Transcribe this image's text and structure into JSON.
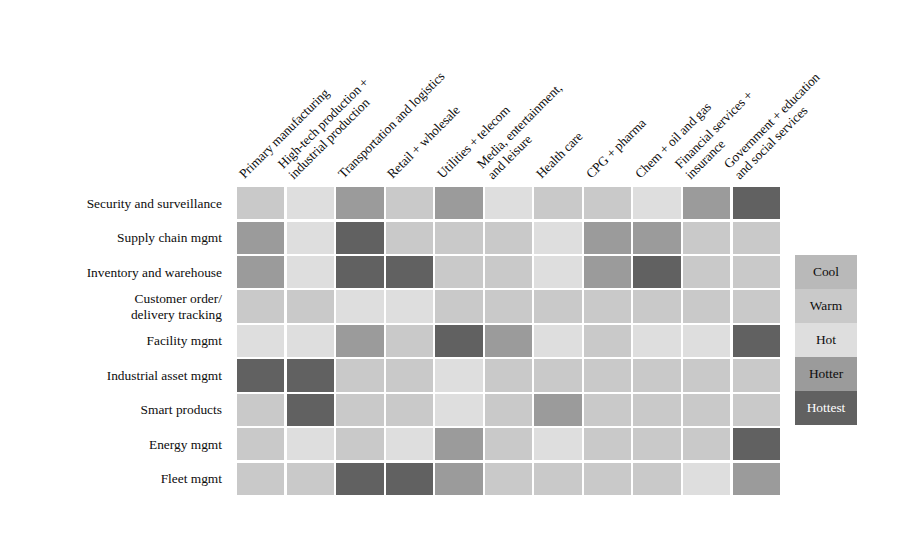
{
  "figure": {
    "type": "heatmap",
    "orientation": "rows-are-use-cases, columns-are-industries"
  },
  "legend": {
    "title": "",
    "items": [
      {
        "label": "Cool",
        "color": "#b9b9b9",
        "level": 1
      },
      {
        "label": "Warm",
        "color": "#c9c9c9",
        "level": 2
      },
      {
        "label": "Hot",
        "color": "#dedede",
        "level": 3
      },
      {
        "label": "Hotter",
        "color": "#9b9b9b",
        "level": 4
      },
      {
        "label": "Hottest",
        "color": "#616161",
        "level": 5
      }
    ]
  },
  "chart_data": {
    "type": "heatmap",
    "title": "",
    "xlabel": "",
    "ylabel": "",
    "grid": true,
    "legend_position": "right",
    "value_scale": [
      "Cool",
      "Warm",
      "Hot",
      "Hotter",
      "Hottest"
    ],
    "colors": {
      "Cool": "#b9b9b9",
      "Warm": "#c9c9c9",
      "Hot": "#dedede",
      "Hotter": "#9b9b9b",
      "Hottest": "#616161"
    },
    "columns": [
      "Primary manufacturing",
      "High-tech production +\nindustrial production",
      "Transportation and logistics",
      "Retail + wholesale",
      "Utilities + telecom",
      "Media, entertainment,\nand leisure",
      "Health care",
      "CPG + pharma",
      "Chem + oil and gas",
      "Financial services +\ninsurance",
      "Government + education\nand social services"
    ],
    "rows": [
      "Security and surveillance",
      "Supply chain mgmt",
      "Inventory and warehouse",
      "Customer order/\ndelivery tracking",
      "Facility mgmt",
      "Industrial asset mgmt",
      "Smart products",
      "Energy mgmt",
      "Fleet mgmt"
    ],
    "values": [
      [
        "Warm",
        "Hot",
        "Hotter",
        "Warm",
        "Hotter",
        "Hot",
        "Warm",
        "Warm",
        "Hot",
        "Hotter",
        "Hottest"
      ],
      [
        "Hotter",
        "Hot",
        "Hottest",
        "Warm",
        "Warm",
        "Warm",
        "Hot",
        "Hotter",
        "Hotter",
        "Warm",
        "Warm"
      ],
      [
        "Hotter",
        "Hot",
        "Hottest",
        "Hottest",
        "Warm",
        "Warm",
        "Hot",
        "Hotter",
        "Hottest",
        "Warm",
        "Warm"
      ],
      [
        "Warm",
        "Warm",
        "Hot",
        "Hot",
        "Warm",
        "Warm",
        "Warm",
        "Warm",
        "Warm",
        "Warm",
        "Warm"
      ],
      [
        "Hot",
        "Hot",
        "Hotter",
        "Warm",
        "Hottest",
        "Hotter",
        "Hot",
        "Warm",
        "Hot",
        "Hot",
        "Hottest"
      ],
      [
        "Hottest",
        "Hottest",
        "Warm",
        "Warm",
        "Hot",
        "Warm",
        "Warm",
        "Warm",
        "Warm",
        "Warm",
        "Warm"
      ],
      [
        "Warm",
        "Hottest",
        "Warm",
        "Warm",
        "Hot",
        "Warm",
        "Hotter",
        "Warm",
        "Warm",
        "Warm",
        "Warm"
      ],
      [
        "Warm",
        "Hot",
        "Warm",
        "Hot",
        "Hotter",
        "Warm",
        "Hot",
        "Warm",
        "Warm",
        "Warm",
        "Hottest"
      ],
      [
        "Warm",
        "Warm",
        "Hottest",
        "Hottest",
        "Hotter",
        "Warm",
        "Warm",
        "Warm",
        "Warm",
        "Hot",
        "Hotter"
      ]
    ]
  }
}
